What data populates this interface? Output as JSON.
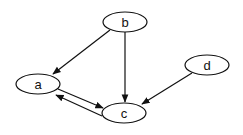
{
  "diagram": {
    "type": "directed-graph",
    "nodes": [
      {
        "id": "b",
        "label": "b",
        "cx": 125,
        "cy": 22,
        "rx": 22,
        "ry": 10
      },
      {
        "id": "a",
        "label": "a",
        "cx": 38,
        "cy": 84,
        "rx": 22,
        "ry": 10
      },
      {
        "id": "c",
        "label": "c",
        "cx": 124,
        "cy": 113,
        "rx": 22,
        "ry": 10
      },
      {
        "id": "d",
        "label": "d",
        "cx": 207,
        "cy": 65,
        "rx": 22,
        "ry": 10
      }
    ],
    "edges": [
      {
        "from": "b",
        "to": "a"
      },
      {
        "from": "b",
        "to": "c"
      },
      {
        "from": "d",
        "to": "c"
      },
      {
        "from": "a",
        "to": "c"
      },
      {
        "from": "c",
        "to": "a"
      }
    ],
    "colors": {
      "stroke": "#111111",
      "background": "#ffffff"
    }
  }
}
